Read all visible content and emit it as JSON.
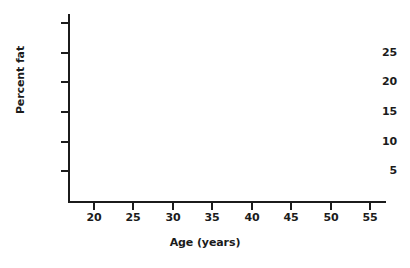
{
  "chart_data": {
    "type": "scatter",
    "title": "",
    "subtitle": "",
    "xlabel": "Age (years)",
    "ylabel": "Percent fat",
    "x": [],
    "values": [],
    "series": [],
    "annotations": [],
    "legend": [],
    "legend_position": "none",
    "grid": false,
    "xlim": [
      17,
      57
    ],
    "ylim": [
      0,
      31.5
    ],
    "xticks": [
      20,
      25,
      30,
      35,
      40,
      45,
      50,
      55
    ],
    "xtick_labels": [
      "20",
      "25",
      "30",
      "35",
      "40",
      "45",
      "50",
      "55"
    ],
    "yticks": [
      5,
      10,
      15,
      20,
      25,
      30
    ],
    "ytick_labels": [
      "5",
      "10",
      "15",
      "20",
      "25",
      ""
    ],
    "note": "empty axes template, no data plotted"
  },
  "figure": {
    "background_color": "#ffffff",
    "axis_color": "#1b1b1b",
    "text_color": "#1b1b1b"
  },
  "axes": {
    "x": {
      "title": "Age (years)",
      "ticks": [
        {
          "value": 20,
          "label": "20"
        },
        {
          "value": 25,
          "label": "25"
        },
        {
          "value": 30,
          "label": "30"
        },
        {
          "value": 35,
          "label": "35"
        },
        {
          "value": 40,
          "label": "40"
        },
        {
          "value": 45,
          "label": "45"
        },
        {
          "value": 50,
          "label": "50"
        },
        {
          "value": 55,
          "label": "55"
        }
      ]
    },
    "y": {
      "title": "Percent fat",
      "ticks": [
        {
          "value": 5,
          "label": "5"
        },
        {
          "value": 10,
          "label": "10"
        },
        {
          "value": 15,
          "label": "15"
        },
        {
          "value": 20,
          "label": "20"
        },
        {
          "value": 25,
          "label": "25"
        },
        {
          "value": 30,
          "label": ""
        }
      ]
    }
  }
}
